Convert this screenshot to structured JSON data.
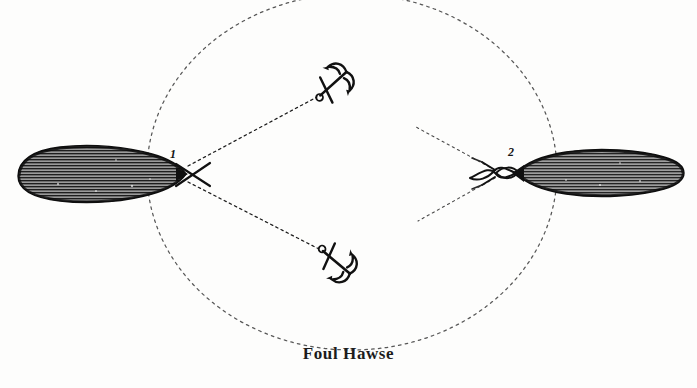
{
  "figure": {
    "caption": "Foul Hawse",
    "background_color": "#fdfdfc",
    "ink_color": "#1a1a1a",
    "hull_fill_color": "#8d8d8d",
    "hull_hatch_color": "#1f1f1f",
    "width": 697,
    "height": 388
  },
  "swinging_circle": {
    "name": "dotted swinging circle",
    "center_x": 352,
    "center_y": 172,
    "radius_x": 205,
    "radius_y": 178,
    "style": "dotted"
  },
  "vessels": [
    {
      "label": "1",
      "name": "ship-left",
      "hull_center_x": 88,
      "hull_center_y": 173,
      "hull_length": 148,
      "hull_beam": 44,
      "bow_x": 183,
      "bow_y": 174,
      "hawse_condition": "cross"
    },
    {
      "label": "2",
      "name": "ship-right",
      "hull_center_x": 610,
      "hull_center_y": 172,
      "hull_length": 146,
      "hull_beam": 42,
      "bow_x": 512,
      "bow_y": 173,
      "hawse_condition": "elbow"
    }
  ],
  "anchors": [
    {
      "name": "anchor-upper",
      "ring_x": 320,
      "ring_y": 95,
      "crown_x": 348,
      "crown_y": 70,
      "orientation_deg": -42
    },
    {
      "name": "anchor-lower",
      "ring_x": 322,
      "ring_y": 250,
      "crown_x": 350,
      "crown_y": 273,
      "orientation_deg": 40
    }
  ],
  "cables": [
    {
      "name": "cable-ship1-to-upper-anchor",
      "from_x": 188,
      "from_y": 166,
      "to_x": 318,
      "to_y": 97,
      "style": "dotted"
    },
    {
      "name": "cable-ship1-to-lower-anchor",
      "from_x": 188,
      "from_y": 182,
      "to_x": 320,
      "to_y": 249,
      "style": "dotted"
    },
    {
      "name": "cable-ship2-upper",
      "from_x": 497,
      "from_y": 172,
      "to_x": 416,
      "to_y": 128,
      "style": "dotted"
    },
    {
      "name": "cable-ship2-lower",
      "from_x": 497,
      "from_y": 176,
      "to_x": 418,
      "to_y": 220,
      "style": "dotted"
    }
  ]
}
